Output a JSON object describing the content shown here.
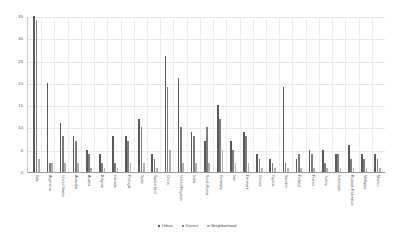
{
  "chart_data": {
    "type": "bar",
    "title": "",
    "subtitle": "",
    "xlabel": "",
    "ylabel": "",
    "ylim": [
      0,
      35
    ],
    "yticks": [
      0,
      5,
      10,
      15,
      20,
      25,
      30,
      35
    ],
    "ytick_labels": [
      "0",
      "5",
      "10",
      "15",
      "20",
      "25",
      "30",
      "35"
    ],
    "grid": true,
    "legend_position": "bottom",
    "categories": [
      "Italy",
      "Argentina",
      "United States",
      "Australia",
      "Austria",
      "Belgium",
      "Canada",
      "Portugal",
      "Spain",
      "Switzerland",
      "China",
      "United Kingdom",
      "India",
      "South Korea",
      "Germany",
      "Iran",
      "Denmark",
      "Greece",
      "Cyprus",
      "Sweden",
      "Finland",
      "France",
      "Turkey",
      "Indonesia",
      "Russian Federation",
      "Malaysia",
      "Mexico"
    ],
    "series": [
      {
        "name": "Urban",
        "color": "#595959",
        "values": [
          35,
          20,
          11,
          8,
          5,
          4,
          8,
          8,
          12,
          4,
          26,
          21,
          9,
          7,
          15,
          7,
          9,
          4,
          3,
          19,
          3,
          5,
          5,
          4,
          6,
          4,
          4
        ]
      },
      {
        "name": "District",
        "color": "#7d7d7d",
        "values": [
          34,
          2,
          8,
          7,
          4,
          2,
          2,
          7,
          10,
          3,
          19,
          10,
          8,
          10,
          12,
          5,
          8,
          3,
          2,
          2,
          4,
          4,
          2,
          4,
          3,
          3,
          3
        ]
      },
      {
        "name": "Neighborhood",
        "color": "#b0b0b0",
        "values": [
          3,
          2,
          2,
          2,
          1,
          1,
          1,
          2,
          2,
          1,
          5,
          2,
          2,
          2,
          5,
          2,
          2,
          1,
          1,
          1,
          1,
          1,
          1,
          1,
          1,
          1,
          1
        ]
      }
    ]
  },
  "legend": {
    "items": [
      {
        "label": "Urban"
      },
      {
        "label": "District"
      },
      {
        "label": "Neighborhood"
      }
    ]
  }
}
